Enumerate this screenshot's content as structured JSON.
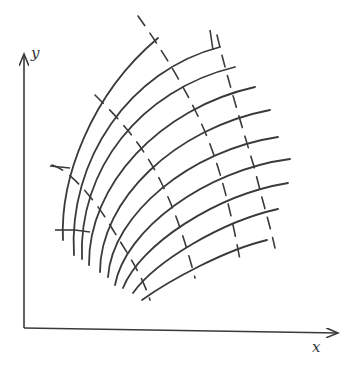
{
  "figure": {
    "title": "",
    "axes": {
      "x_label": "x",
      "y_label": "y",
      "origin": [
        24,
        328
      ],
      "x_axis_end": [
        340,
        333
      ],
      "y_axis_end": [
        24,
        52
      ]
    },
    "colors": {
      "ink": "#3a3a3a",
      "background": "#ffffff"
    },
    "solid_curves": [
      {
        "d": "M63,240 C60,180 90,95 158,38"
      },
      {
        "d": "M74,255 C68,160 130,70 220,47"
      },
      {
        "d": "M82,259 C78,170 140,90 235,67"
      },
      {
        "d": "M89,265 C88,185 160,108 255,87"
      },
      {
        "d": "M100,272 C100,200 175,128 270,110"
      },
      {
        "d": "M108,277 C112,215 190,150 278,137"
      },
      {
        "d": "M115,285 C125,230 205,170 290,159"
      },
      {
        "d": "M123,288 C140,245 215,195 288,183"
      },
      {
        "d": "M133,293 C155,262 220,222 278,209"
      },
      {
        "d": "M142,300 C170,280 225,250 267,240"
      }
    ],
    "dashed_curves": [
      {
        "d": "M52,165 C70,170 95,200 110,225 C125,250 140,270 150,300"
      },
      {
        "d": "M95,95 C115,115 140,140 160,180 C175,210 185,240 195,278"
      },
      {
        "d": "M138,16 C155,40 175,70 195,110 C215,150 228,195 240,260"
      },
      {
        "d": "M217,35 C225,70 240,120 255,170 C262,200 270,225 275,248"
      }
    ],
    "tick_marks": [
      {
        "x1": 50,
        "y1": 166,
        "x2": 70,
        "y2": 168
      },
      {
        "x1": 55,
        "y1": 230,
        "x2": 75,
        "y2": 230
      },
      {
        "x1": 75,
        "y1": 230,
        "x2": 90,
        "y2": 232
      },
      {
        "x1": 210,
        "y1": 30,
        "x2": 213,
        "y2": 50
      }
    ]
  }
}
